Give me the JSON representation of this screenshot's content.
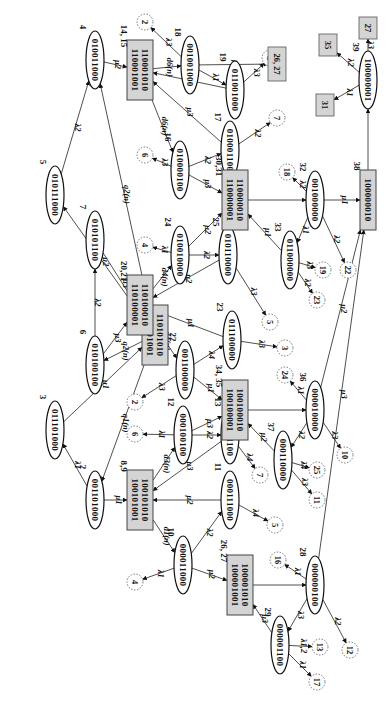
{
  "diagram": {
    "type": "state-transition-diagram",
    "orientation": "rotated-90-clockwise",
    "states": [
      {
        "id": "s01",
        "label": "0,1",
        "bits": [
          "110101010",
          "110101001"
        ],
        "shape": "box",
        "x": 155,
        "y": 335
      },
      {
        "id": "s2",
        "label": "2",
        "bits": [
          "001101000"
        ],
        "shape": "ellipse",
        "x": 95,
        "y": 500
      },
      {
        "id": "s3",
        "label": "3",
        "bits": [
          "011101000"
        ],
        "shape": "ellipse",
        "x": 55,
        "y": 430
      },
      {
        "id": "s4",
        "label": "4",
        "bits": [
          "010011000"
        ],
        "shape": "ellipse",
        "x": 95,
        "y": 60
      },
      {
        "id": "s5",
        "label": "5",
        "bits": [
          "010111000"
        ],
        "shape": "ellipse",
        "x": 55,
        "y": 195
      },
      {
        "id": "s6",
        "label": "6",
        "bits": [
          "010100100"
        ],
        "shape": "ellipse",
        "x": 95,
        "y": 365
      },
      {
        "id": "s7",
        "label": "7",
        "bits": [
          "010101100"
        ],
        "shape": "ellipse",
        "x": 95,
        "y": 240
      },
      {
        "id": "s89",
        "label": "8,9",
        "bits": [
          "100101010",
          "100101001"
        ],
        "shape": "box",
        "x": 140,
        "y": 500
      },
      {
        "id": "s10",
        "label": "10",
        "bits": [
          "000011000"
        ],
        "shape": "ellipse",
        "x": 183,
        "y": 565
      },
      {
        "id": "s11",
        "label": "11",
        "bits": [
          "000111000"
        ],
        "shape": "ellipse",
        "x": 230,
        "y": 500
      },
      {
        "id": "s12",
        "label": "12",
        "bits": [
          "000100100"
        ],
        "shape": "ellipse",
        "x": 183,
        "y": 435
      },
      {
        "id": "s13",
        "label": "13",
        "bits": [
          "000101100"
        ],
        "shape": "ellipse",
        "x": 230,
        "y": 435
      },
      {
        "id": "s1415",
        "label": "14, 15",
        "bits": [
          "110001010",
          "110001001"
        ],
        "shape": "box",
        "x": 140,
        "y": 70
      },
      {
        "id": "s16",
        "label": "16",
        "bits": [
          "010000100"
        ],
        "shape": "ellipse",
        "x": 180,
        "y": 170
      },
      {
        "id": "s17",
        "label": "17",
        "bits": [
          "010001100"
        ],
        "shape": "ellipse",
        "x": 230,
        "y": 150
      },
      {
        "id": "s18",
        "label": "18",
        "bits": [
          "001001000"
        ],
        "shape": "ellipse",
        "x": 190,
        "y": 65
      },
      {
        "id": "s19",
        "label": "19",
        "bits": [
          "011001000"
        ],
        "shape": "ellipse",
        "x": 235,
        "y": 90
      },
      {
        "id": "s2021",
        "label": "20,21",
        "bits": [
          "110100010",
          "110100001"
        ],
        "shape": "box",
        "x": 140,
        "y": 305
      },
      {
        "id": "s22",
        "label": "22",
        "bits": [
          "001100000"
        ],
        "shape": "ellipse",
        "x": 185,
        "y": 370
      },
      {
        "id": "s23",
        "label": "23",
        "bits": [
          "011100000"
        ],
        "shape": "ellipse",
        "x": 232,
        "y": 340
      },
      {
        "id": "s24",
        "label": "24",
        "bits": [
          "010010000"
        ],
        "shape": "ellipse",
        "x": 180,
        "y": 255
      },
      {
        "id": "s25",
        "label": "25",
        "bits": [
          "010110000"
        ],
        "shape": "ellipse",
        "x": 228,
        "y": 255
      },
      {
        "id": "s2627",
        "label": "26, 27",
        "bits": [
          "100001010",
          "100001001"
        ],
        "shape": "box",
        "x": 240,
        "y": 585
      },
      {
        "id": "s28",
        "label": "28",
        "bits": [
          "000000100"
        ],
        "shape": "ellipse",
        "x": 315,
        "y": 585
      },
      {
        "id": "s29",
        "label": "29",
        "bits": [
          "000001100"
        ],
        "shape": "ellipse",
        "x": 280,
        "y": 645
      },
      {
        "id": "s3031",
        "label": "30,31",
        "bits": [
          "110000010",
          "110000001"
        ],
        "shape": "box",
        "x": 235,
        "y": 200
      },
      {
        "id": "s32",
        "label": "32",
        "bits": [
          "001000000"
        ],
        "shape": "ellipse",
        "x": 315,
        "y": 200
      },
      {
        "id": "s33",
        "label": "33",
        "bits": [
          "011000000"
        ],
        "shape": "ellipse",
        "x": 290,
        "y": 260
      },
      {
        "id": "s3435",
        "label": "34, 35",
        "bits": [
          "100100010",
          "100100001"
        ],
        "shape": "box",
        "x": 235,
        "y": 410
      },
      {
        "id": "s36",
        "label": "36",
        "bits": [
          "000010000"
        ],
        "shape": "ellipse",
        "x": 315,
        "y": 410
      },
      {
        "id": "s37",
        "label": "37",
        "bits": [
          "000110000"
        ],
        "shape": "ellipse",
        "x": 283,
        "y": 460
      },
      {
        "id": "s38",
        "label": "38",
        "bits": [
          "100000010"
        ],
        "shape": "box",
        "x": 368,
        "y": 200
      },
      {
        "id": "s39",
        "label": "39",
        "bits": [
          "100000001"
        ],
        "shape": "ellipse",
        "x": 368,
        "y": 80
      }
    ],
    "references": [
      {
        "id": "r2a",
        "label": "2",
        "shape": "circle",
        "x": 145,
        "y": 22
      },
      {
        "id": "r3a",
        "label": "3",
        "shape": "circle",
        "x": 270,
        "y": 58
      },
      {
        "id": "r7a",
        "label": "7",
        "shape": "circle",
        "x": 277,
        "y": 118
      },
      {
        "id": "r6a",
        "label": "6",
        "shape": "circle",
        "x": 145,
        "y": 155
      },
      {
        "id": "r18",
        "label": "18",
        "shape": "circle",
        "x": 287,
        "y": 172
      },
      {
        "id": "r4a",
        "label": "4",
        "shape": "circle",
        "x": 145,
        "y": 245
      },
      {
        "id": "r19",
        "label": "19",
        "shape": "circle",
        "x": 323,
        "y": 270
      },
      {
        "id": "r22",
        "label": "22",
        "shape": "circle",
        "x": 348,
        "y": 270
      },
      {
        "id": "r23",
        "label": "23",
        "shape": "circle",
        "x": 317,
        "y": 300
      },
      {
        "id": "r5a",
        "label": "5",
        "shape": "circle",
        "x": 270,
        "y": 322
      },
      {
        "id": "r3b",
        "label": "3",
        "shape": "circle",
        "x": 285,
        "y": 348
      },
      {
        "id": "r2b",
        "label": "2",
        "shape": "circle",
        "x": 135,
        "y": 402
      },
      {
        "id": "r6b",
        "label": "6",
        "shape": "circle",
        "x": 135,
        "y": 434
      },
      {
        "id": "r24",
        "label": "24",
        "shape": "circle",
        "x": 285,
        "y": 375
      },
      {
        "id": "r7b",
        "label": "7",
        "shape": "circle",
        "x": 260,
        "y": 475
      },
      {
        "id": "r25",
        "label": "25",
        "shape": "circle",
        "x": 317,
        "y": 470
      },
      {
        "id": "r10",
        "label": "10",
        "shape": "circle",
        "x": 345,
        "y": 455
      },
      {
        "id": "r11",
        "label": "11",
        "shape": "circle",
        "x": 317,
        "y": 500
      },
      {
        "id": "r5b",
        "label": "5",
        "shape": "circle",
        "x": 275,
        "y": 525
      },
      {
        "id": "r4b",
        "label": "4",
        "shape": "circle",
        "x": 135,
        "y": 582
      },
      {
        "id": "r16",
        "label": "16",
        "shape": "circle",
        "x": 278,
        "y": 560
      },
      {
        "id": "r13",
        "label": "13",
        "shape": "circle",
        "x": 320,
        "y": 647
      },
      {
        "id": "r12",
        "label": "12",
        "shape": "circle",
        "x": 350,
        "y": 650
      },
      {
        "id": "r17",
        "label": "17",
        "shape": "circle",
        "x": 317,
        "y": 682
      },
      {
        "id": "r2627",
        "label": "26, 27",
        "shape": "box",
        "x": 277,
        "y": 64
      },
      {
        "id": "r35",
        "label": "35",
        "shape": "box",
        "x": 328,
        "y": 45
      },
      {
        "id": "r27",
        "label": "27",
        "shape": "box",
        "x": 368,
        "y": 28
      },
      {
        "id": "r31",
        "label": "31",
        "shape": "box",
        "x": 325,
        "y": 105
      }
    ],
    "transitions": [
      {
        "from": "s01",
        "to": "s5",
        "label": "μ2"
      },
      {
        "from": "s5",
        "to": "s4",
        "label": "λ2"
      },
      {
        "from": "s01",
        "to": "s4",
        "label": "q2(n)"
      },
      {
        "from": "s4",
        "to": "s1415",
        "label": "μ2"
      },
      {
        "from": "s6",
        "to": "s7",
        "label": "λ2"
      },
      {
        "from": "s7",
        "to": "s01",
        "label": "μ3"
      },
      {
        "from": "s01",
        "to": "s6",
        "label": "q2(n)"
      },
      {
        "from": "s6",
        "to": "s2021",
        "label": "μ3"
      },
      {
        "from": "s3",
        "to": "s01",
        "label": "μ1"
      },
      {
        "from": "s01",
        "to": "s2",
        "label": "q1(n)"
      },
      {
        "from": "s2",
        "to": "s3",
        "label": "λ1"
      },
      {
        "from": "s2",
        "to": "s89",
        "label": "μ1"
      },
      {
        "from": "s1415",
        "to": "s18",
        "label": "d6(n)"
      },
      {
        "from": "s1415",
        "to": "s16",
        "label": "d6(n)"
      },
      {
        "from": "s18",
        "to": "r2a",
        "label": "λ3"
      },
      {
        "from": "s18",
        "to": "s19",
        "label": "λ1"
      },
      {
        "from": "s18",
        "to": "r2627",
        "label": "μ1"
      },
      {
        "from": "s19",
        "to": "s1415",
        "label": "μ1"
      },
      {
        "from": "s19",
        "to": "r3a",
        "label": "λ3"
      },
      {
        "from": "s16",
        "to": "r6a",
        "label": "λ3"
      },
      {
        "from": "s16",
        "to": "s17",
        "label": "λ2"
      },
      {
        "from": "s16",
        "to": "s3031",
        "label": "μ3"
      },
      {
        "from": "s17",
        "to": "s1415",
        "label": "μ3"
      },
      {
        "from": "s17",
        "to": "r7a",
        "label": "λ2"
      },
      {
        "from": "s2021",
        "to": "s24",
        "label": "d4(n)"
      },
      {
        "from": "s2021",
        "to": "s22",
        "label": "d4(n)"
      },
      {
        "from": "s24",
        "to": "r4a",
        "label": "λ1"
      },
      {
        "from": "s24",
        "to": "s25",
        "label": "λ2"
      },
      {
        "from": "s24",
        "to": "s3031",
        "label": "μ2"
      },
      {
        "from": "s25",
        "to": "s2021",
        "label": "μ2"
      },
      {
        "from": "s25",
        "to": "r5a",
        "label": "λ3"
      },
      {
        "from": "s22",
        "to": "r2b",
        "label": "λ3"
      },
      {
        "from": "s22",
        "to": "s23",
        "label": "λ4"
      },
      {
        "from": "s22",
        "to": "s3435",
        "label": "μ1"
      },
      {
        "from": "s23",
        "to": "s2021",
        "label": "μ1"
      },
      {
        "from": "s23",
        "to": "r3b",
        "label": "λ3"
      },
      {
        "from": "s89",
        "to": "s12",
        "label": "d3(n)"
      },
      {
        "from": "s89",
        "to": "s10",
        "label": "d1(n)"
      },
      {
        "from": "s12",
        "to": "r6b",
        "label": "λ1"
      },
      {
        "from": "s12",
        "to": "s13",
        "label": "λ2"
      },
      {
        "from": "s12",
        "to": "s3435",
        "label": "μ3"
      },
      {
        "from": "s13",
        "to": "s89",
        "label": "μ3"
      },
      {
        "from": "s13",
        "to": "r7b",
        "label": "λ4"
      },
      {
        "from": "s10",
        "to": "r4b",
        "label": "λ1"
      },
      {
        "from": "s10",
        "to": "s11",
        "label": "λ2"
      },
      {
        "from": "s10",
        "to": "s2627",
        "label": "μ2"
      },
      {
        "from": "s11",
        "to": "s89",
        "label": "μ2"
      },
      {
        "from": "s11",
        "to": "r5b",
        "label": "λ4"
      },
      {
        "from": "s3031",
        "to": "s32",
        "label": ""
      },
      {
        "from": "s32",
        "to": "r18",
        "label": "λ2"
      },
      {
        "from": "s32",
        "to": "s33",
        "label": "λ1"
      },
      {
        "from": "s32",
        "to": "s38",
        "label": "μ1"
      },
      {
        "from": "s32",
        "to": "r22",
        "label": "λ2"
      },
      {
        "from": "s33",
        "to": "s3031",
        "label": "μ1"
      },
      {
        "from": "s33",
        "to": "r19",
        "label": "λ3"
      },
      {
        "from": "s33",
        "to": "r23",
        "label": "λ2"
      },
      {
        "from": "s3435",
        "to": "s36",
        "label": ""
      },
      {
        "from": "s36",
        "to": "r24",
        "label": "λ1"
      },
      {
        "from": "s36",
        "to": "s37",
        "label": "λ2"
      },
      {
        "from": "s36",
        "to": "s38",
        "label": "μ2"
      },
      {
        "from": "s36",
        "to": "r10",
        "label": "λ3"
      },
      {
        "from": "s37",
        "to": "s3435",
        "label": "μ2"
      },
      {
        "from": "s37",
        "to": "r25",
        "label": "λ4"
      },
      {
        "from": "s37",
        "to": "r11",
        "label": "λ3"
      },
      {
        "from": "s2627",
        "to": "s28",
        "label": ""
      },
      {
        "from": "s28",
        "to": "r16",
        "label": "λ1"
      },
      {
        "from": "s28",
        "to": "s29",
        "label": "λ3"
      },
      {
        "from": "s28",
        "to": "s38",
        "label": "μ3"
      },
      {
        "from": "s28",
        "to": "r12",
        "label": "λ2"
      },
      {
        "from": "s29",
        "to": "s2627",
        "label": "μ3"
      },
      {
        "from": "s29",
        "to": "r13",
        "label": "λ1,2"
      },
      {
        "from": "s29",
        "to": "r17",
        "label": "λ1"
      },
      {
        "from": "s38",
        "to": "s39",
        "label": ""
      },
      {
        "from": "s39",
        "to": "r31",
        "label": "λ1"
      },
      {
        "from": "s39",
        "to": "r35",
        "label": "λ2"
      },
      {
        "from": "s39",
        "to": "r27",
        "label": "λ3"
      }
    ]
  }
}
